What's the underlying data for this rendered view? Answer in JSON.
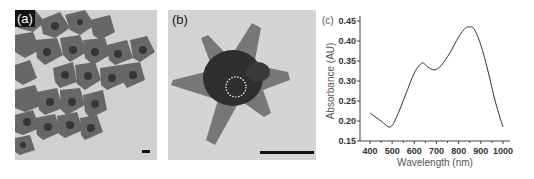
{
  "panels": {
    "a": {
      "label": "(a)"
    },
    "b": {
      "label": "(b)"
    },
    "c": {
      "label": "(c)"
    }
  },
  "chart_data": {
    "type": "line",
    "title": "",
    "panel_label": "(c)",
    "xlabel": "Wavelength (nm)",
    "ylabel": "Absorbance (AU)",
    "xlim": [
      400,
      1000
    ],
    "ylim": [
      0.15,
      0.45
    ],
    "xticks": [
      "400",
      "500",
      "600",
      "700",
      "800",
      "900",
      "1000"
    ],
    "yticks": [
      "0.15",
      "0.20",
      "0.25",
      "0.30",
      "0.35",
      "0.40",
      "0.45"
    ],
    "grid": false,
    "legend": null,
    "series": [
      {
        "name": "Absorbance",
        "x": [
          400,
          450,
          490,
          520,
          560,
          600,
          635,
          660,
          690,
          720,
          760,
          800,
          830,
          850,
          870,
          900,
          930,
          960,
          980,
          1000
        ],
        "y": [
          0.22,
          0.2,
          0.185,
          0.21,
          0.265,
          0.32,
          0.345,
          0.335,
          0.328,
          0.338,
          0.37,
          0.41,
          0.432,
          0.435,
          0.43,
          0.39,
          0.33,
          0.26,
          0.22,
          0.185
        ]
      }
    ]
  }
}
